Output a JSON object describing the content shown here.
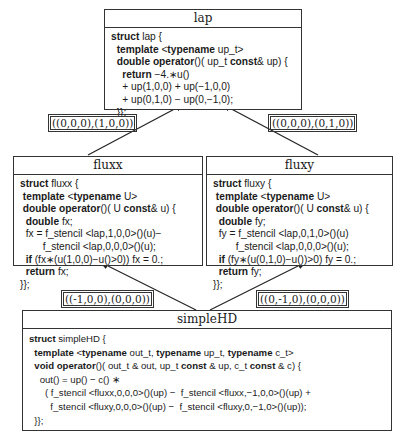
{
  "nodes": {
    "lap": {
      "title": "lap",
      "lines": [
        [
          {
            "t": "struct",
            "k": 1
          },
          {
            "t": " lap {"
          }
        ],
        [
          {
            "t": "  template",
            "k": 1
          },
          {
            "t": " <"
          },
          {
            "t": "typename",
            "k": 1
          },
          {
            "t": " up_t>"
          }
        ],
        [
          {
            "t": "  double operator",
            "k": 1
          },
          {
            "t": "()( up_t "
          },
          {
            "t": "const",
            "k": 1
          },
          {
            "t": "& up) {"
          }
        ],
        [
          {
            "t": "    return",
            "k": 1
          },
          {
            "t": " −4.∗u()"
          }
        ],
        [
          {
            "t": "    + up(1,0,0) + up(−1,0,0)"
          }
        ],
        [
          {
            "t": "    + up(0,1,0) − up(0,−1,0);"
          }
        ],
        [
          {
            "t": "  }};"
          }
        ]
      ]
    },
    "fluxx": {
      "title": "fluxx",
      "lines": [
        [
          {
            "t": "struct",
            "k": 1
          },
          {
            "t": " fluxx {"
          }
        ],
        [
          {
            "t": " template",
            "k": 1
          },
          {
            "t": " <"
          },
          {
            "t": "typename",
            "k": 1
          },
          {
            "t": " U>"
          }
        ],
        [
          {
            "t": " double operator",
            "k": 1
          },
          {
            "t": "()( U "
          },
          {
            "t": "const",
            "k": 1
          },
          {
            "t": "& u) {"
          }
        ],
        [
          {
            "t": "  double",
            "k": 1
          },
          {
            "t": " fx;"
          }
        ],
        [
          {
            "t": "  fx = f_stencil <lap,1,0,0>()(u)−"
          }
        ],
        [
          {
            "t": "        f_stencil <lap,0,0,0>()(u);"
          }
        ],
        [
          {
            "t": "  if",
            "k": 1
          },
          {
            "t": " (fx∗(u(1,0,0)−u()>0)) fx = 0.;"
          }
        ],
        [
          {
            "t": "  return",
            "k": 1
          },
          {
            "t": " fx;"
          }
        ],
        [
          {
            "t": "}};"
          }
        ]
      ]
    },
    "fluxy": {
      "title": "fluxy",
      "lines": [
        [
          {
            "t": "struct",
            "k": 1
          },
          {
            "t": " fluxy {"
          }
        ],
        [
          {
            "t": " template",
            "k": 1
          },
          {
            "t": " <"
          },
          {
            "t": "typename",
            "k": 1
          },
          {
            "t": " U>"
          }
        ],
        [
          {
            "t": " double operator",
            "k": 1
          },
          {
            "t": "()( U "
          },
          {
            "t": "const",
            "k": 1
          },
          {
            "t": "& u) {"
          }
        ],
        [
          {
            "t": "  double",
            "k": 1
          },
          {
            "t": " fy;"
          }
        ],
        [
          {
            "t": "  fy = f_stencil <lap,0,1,0>()(u)"
          }
        ],
        [
          {
            "t": "        f_stencil <lap,0,0,0>()(u);"
          }
        ],
        [
          {
            "t": "  if",
            "k": 1
          },
          {
            "t": " (fy∗(u(0,1,0)−u())>0) fy = 0.;"
          }
        ],
        [
          {
            "t": "  return",
            "k": 1
          },
          {
            "t": " fy;"
          }
        ],
        [
          {
            "t": "}};"
          }
        ]
      ]
    },
    "simpleHD": {
      "title": "simpleHD",
      "lines": [
        [
          {
            "t": "struct",
            "k": 1
          },
          {
            "t": " simpleHD {"
          }
        ],
        [
          {
            "t": "  template",
            "k": 1
          },
          {
            "t": " <"
          },
          {
            "t": "typename",
            "k": 1
          },
          {
            "t": " out_t, "
          },
          {
            "t": "typename",
            "k": 1
          },
          {
            "t": " up_t, "
          },
          {
            "t": "typename",
            "k": 1
          },
          {
            "t": " c_t>"
          }
        ],
        [
          {
            "t": "  void operator",
            "k": 1
          },
          {
            "t": "()( out_t & out, up_t "
          },
          {
            "t": "const",
            "k": 1
          },
          {
            "t": " & up, c_t "
          },
          {
            "t": "const",
            "k": 1
          },
          {
            "t": " & c) {"
          }
        ],
        [
          {
            "t": "    out() = up() − c() ∗"
          }
        ],
        [
          {
            "t": "      ( f_stencil <fluxx,0,0,0>()(up) −  f_stencil <fluxx,−1,0,0>()(up) +"
          }
        ],
        [
          {
            "t": "        f_stencil <fluxy,0,0,0>()(up) −  f_stencil <fluxy,0,−1,0>()(up));"
          }
        ],
        [
          {
            "t": "  }};"
          }
        ]
      ]
    }
  },
  "edges": [
    {
      "from": "fluxx",
      "to": "lap",
      "label": "((0,0,0),(1,0,0))"
    },
    {
      "from": "fluxy",
      "to": "lap",
      "label": "((0,0,0),(0,1,0))"
    },
    {
      "from": "simpleHD",
      "to": "fluxx",
      "label": "((-1,0,0),(0,0,0))"
    },
    {
      "from": "simpleHD",
      "to": "fluxy",
      "label": "((0,-1,0),(0,0,0))"
    }
  ]
}
